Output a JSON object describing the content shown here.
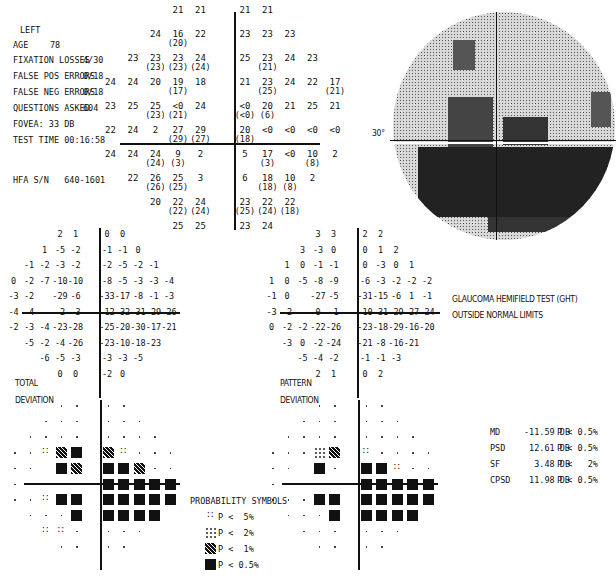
{
  "header": {
    "eye": "LEFT",
    "age_label": "AGE",
    "age": "78",
    "fixation_losses_label": "FIXATION LOSSES",
    "fixation_losses": "4/30",
    "false_pos_label": "FALSE POS ERRORS",
    "false_pos": "0/18",
    "false_neg_label": "FALSE NEG ERRORS",
    "false_neg": "0/18",
    "questions_label": "QUESTIONS ASKED",
    "questions": "604",
    "fovea": "FOVEA: 33 DB",
    "test_time": "TEST TIME 00:16:58",
    "hfa_sn": "HFA S/N   640-1601"
  },
  "threshold_grid": {
    "rows": [
      {
        "y": 4,
        "cells": [
          [
            "21",
            ""
          ],
          [
            "21",
            ""
          ],
          [
            "21",
            ""
          ],
          [
            "21",
            ""
          ]
        ],
        "cols": [
          -2,
          -1,
          0,
          1
        ]
      },
      {
        "y": 3,
        "cells": [
          [
            "24",
            ""
          ],
          [
            "16",
            "(20)"
          ],
          [
            "22",
            ""
          ],
          [
            "23",
            ""
          ],
          [
            "23",
            ""
          ],
          [
            "23",
            ""
          ]
        ],
        "cols": [
          -3,
          -2,
          -1,
          0,
          1,
          2
        ]
      },
      {
        "y": 2,
        "cells": [
          [
            "23",
            ""
          ],
          [
            "23",
            "(23)"
          ],
          [
            "23",
            "(23)"
          ],
          [
            "24",
            "(24)"
          ],
          [
            "25",
            ""
          ],
          [
            "23",
            "(21)"
          ],
          [
            "24",
            ""
          ],
          [
            "23",
            ""
          ]
        ],
        "cols": [
          -4,
          -3,
          -2,
          -1,
          0,
          1,
          2,
          3
        ]
      },
      {
        "y": 1,
        "cells": [
          [
            "24",
            ""
          ],
          [
            "24",
            ""
          ],
          [
            "20",
            ""
          ],
          [
            "19",
            "(17)"
          ],
          [
            "18",
            ""
          ],
          [
            "21",
            ""
          ],
          [
            "23",
            "(25)"
          ],
          [
            "24",
            ""
          ],
          [
            "22",
            ""
          ],
          [
            "17",
            "(21)"
          ]
        ],
        "cols": [
          -5,
          -4,
          -3,
          -2,
          -1,
          0,
          1,
          2,
          3,
          4
        ]
      },
      {
        "y": 0,
        "cells": [
          [
            "23",
            ""
          ],
          [
            "25",
            ""
          ],
          [
            "25",
            "(23)"
          ],
          [
            "<0",
            "(21)"
          ],
          [
            "24",
            ""
          ],
          [
            "<0",
            "(<0)"
          ],
          [
            "20",
            "(6)"
          ],
          [
            "21",
            ""
          ],
          [
            "25",
            ""
          ],
          [
            "21",
            ""
          ]
        ],
        "cols": [
          -5,
          -4,
          -3,
          -2,
          -1,
          0,
          1,
          2,
          3,
          4
        ]
      },
      {
        "y": -1,
        "cells": [
          [
            "22",
            ""
          ],
          [
            "24",
            ""
          ],
          [
            "2",
            ""
          ],
          [
            "27",
            "(29)"
          ],
          [
            "29",
            "(27)"
          ],
          [
            "20",
            "(18)"
          ],
          [
            "<0",
            ""
          ],
          [
            "<0",
            ""
          ],
          [
            "<0",
            ""
          ],
          [
            "<0",
            ""
          ]
        ],
        "cols": [
          -5,
          -4,
          -3,
          -2,
          -1,
          0,
          1,
          2,
          3,
          4
        ]
      },
      {
        "y": -2,
        "cells": [
          [
            "24",
            ""
          ],
          [
            "24",
            ""
          ],
          [
            "24",
            "(24)"
          ],
          [
            "9",
            "(3)"
          ],
          [
            "2",
            ""
          ],
          [
            "5",
            ""
          ],
          [
            "17",
            "(3)"
          ],
          [
            "<0",
            ""
          ],
          [
            "10",
            "(8)"
          ],
          [
            "2",
            ""
          ]
        ],
        "cols": [
          -5,
          -4,
          -3,
          -2,
          -1,
          0,
          1,
          2,
          3,
          4
        ]
      },
      {
        "y": -3,
        "cells": [
          [
            "22",
            ""
          ],
          [
            "26",
            "(26)"
          ],
          [
            "25",
            "(25)"
          ],
          [
            "3",
            ""
          ],
          [
            "6",
            ""
          ],
          [
            "18",
            "(18)"
          ],
          [
            "10",
            "(8)"
          ],
          [
            "2",
            ""
          ]
        ],
        "cols": [
          -4,
          -3,
          -2,
          -1,
          0,
          1,
          2,
          3
        ]
      },
      {
        "y": -4,
        "cells": [
          [
            "20",
            ""
          ],
          [
            "22",
            "(22)"
          ],
          [
            "24",
            "(24)"
          ],
          [
            "23",
            "(25)"
          ],
          [
            "22",
            "(24)"
          ],
          [
            "22",
            "(18)"
          ]
        ],
        "cols": [
          -3,
          -2,
          -1,
          0,
          1,
          2
        ]
      },
      {
        "y": -5,
        "cells": [
          [
            "25",
            ""
          ],
          [
            "25",
            ""
          ],
          [
            "23",
            ""
          ],
          [
            "24",
            ""
          ]
        ],
        "cols": [
          -2,
          -1,
          0,
          1
        ]
      }
    ]
  },
  "greyscale": {
    "label": "30°"
  },
  "total_deviation": {
    "label_1": "TOTAL",
    "label_2": "DEVIATION",
    "rows": [
      {
        "cols": [
          -2,
          -1,
          0,
          1
        ],
        "vals": [
          "2",
          "1",
          "0",
          "0"
        ]
      },
      {
        "cols": [
          -3,
          -2,
          -1,
          0,
          1,
          2
        ],
        "vals": [
          "1",
          "-5",
          "-2",
          "-1",
          "-1",
          "0"
        ]
      },
      {
        "cols": [
          -4,
          -3,
          -2,
          -1,
          0,
          1,
          2,
          3
        ],
        "vals": [
          "-1",
          "-2",
          "-3",
          "-2",
          "-2",
          "-5",
          "-2",
          "-1"
        ]
      },
      {
        "cols": [
          -5,
          -4,
          -3,
          -2,
          -1,
          0,
          1,
          2,
          3,
          4
        ],
        "vals": [
          "0",
          "-2",
          "-7",
          "-10",
          "-10",
          "-8",
          "-5",
          "-3",
          "-3",
          "-4"
        ]
      },
      {
        "cols": [
          -5,
          -4,
          -2,
          -1,
          0,
          1,
          2,
          3,
          4
        ],
        "vals": [
          "-3",
          "-2",
          "-29",
          "-6",
          "-33",
          "-17",
          "-8",
          "-1",
          "-3"
        ]
      },
      {
        "cols": [
          -5,
          -4,
          -2,
          -1,
          0,
          1,
          2,
          3,
          4
        ],
        "vals": [
          "-4",
          "-4",
          "-2",
          "-3",
          "-12",
          "-32",
          "-31",
          "-29",
          "-26"
        ]
      },
      {
        "cols": [
          -5,
          -4,
          -3,
          -2,
          -1,
          0,
          1,
          2,
          3,
          4
        ],
        "vals": [
          "-2",
          "-3",
          "-4",
          "-23",
          "-28",
          "-25",
          "-20",
          "-30",
          "-17",
          "-21"
        ]
      },
      {
        "cols": [
          -4,
          -3,
          -2,
          -1,
          0,
          1,
          2,
          3
        ],
        "vals": [
          "-5",
          "-2",
          "-4",
          "-26",
          "-23",
          "-10",
          "-18",
          "-23"
        ]
      },
      {
        "cols": [
          -3,
          -2,
          -1,
          0,
          1,
          2
        ],
        "vals": [
          "-6",
          "-5",
          "-3",
          "-3",
          "-3",
          "-5"
        ]
      },
      {
        "cols": [
          -2,
          -1,
          0,
          1
        ],
        "vals": [
          "0",
          "0",
          "-2",
          "0"
        ]
      }
    ],
    "prob_rows": [
      {
        "cols": [
          -2,
          -1,
          0,
          1
        ],
        "s": [
          "dot",
          "dot",
          "dot",
          "dot"
        ]
      },
      {
        "cols": [
          -3,
          -2,
          -1,
          0,
          1,
          2
        ],
        "s": [
          "dot",
          "dot",
          "dot",
          "dot",
          "dot",
          "dot"
        ]
      },
      {
        "cols": [
          -4,
          -3,
          -2,
          -1,
          0,
          1,
          2,
          3
        ],
        "s": [
          "dot",
          "dot",
          "dot",
          "dot",
          "dot",
          "dot",
          "dot",
          "dot"
        ]
      },
      {
        "cols": [
          -5,
          -4,
          -3,
          -2,
          -1,
          0,
          1,
          2,
          3,
          4
        ],
        "s": [
          "dot",
          "dot",
          "p5",
          "p1",
          "p05",
          "p1",
          "p5",
          "dot",
          "dot",
          "dot"
        ]
      },
      {
        "cols": [
          -5,
          -4,
          -2,
          -1,
          0,
          1,
          2,
          3,
          4
        ],
        "s": [
          "dot",
          "dot",
          "p05",
          "p1",
          "p05",
          "p05",
          "p1",
          "dot",
          "dot"
        ]
      },
      {
        "cols": [
          -5,
          -4,
          -2,
          -1,
          0,
          1,
          2,
          3,
          4
        ],
        "s": [
          "dot",
          "dot",
          "dot",
          "dot",
          "p05",
          "p05",
          "p05",
          "p05",
          "p05"
        ]
      },
      {
        "cols": [
          -5,
          -4,
          -3,
          -2,
          -1,
          0,
          1,
          2,
          3,
          4
        ],
        "s": [
          "dot",
          "dot",
          "p5",
          "p05",
          "p05",
          "p05",
          "p05",
          "p05",
          "p05",
          "p05"
        ]
      },
      {
        "cols": [
          -4,
          -3,
          -2,
          -1,
          0,
          1,
          2,
          3
        ],
        "s": [
          "dot",
          "dot",
          "dot",
          "p05",
          "p05",
          "p05",
          "p05",
          "p05"
        ]
      },
      {
        "cols": [
          -3,
          -2,
          -1,
          0,
          1,
          2
        ],
        "s": [
          "p5",
          "p5",
          "dot",
          "dot",
          "dot",
          "dot"
        ]
      },
      {
        "cols": [
          -2,
          -1,
          0,
          1
        ],
        "s": [
          "dot",
          "dot",
          "dot",
          "dot"
        ]
      }
    ]
  },
  "pattern_deviation": {
    "label_1": "PATTERN",
    "label_2": "DEVIATION",
    "rows": [
      {
        "cols": [
          -2,
          -1,
          0,
          1
        ],
        "vals": [
          "3",
          "3",
          "2",
          "2"
        ]
      },
      {
        "cols": [
          -3,
          -2,
          -1,
          0,
          1,
          2
        ],
        "vals": [
          "3",
          "-3",
          "0",
          "0",
          "1",
          "2"
        ]
      },
      {
        "cols": [
          -4,
          -3,
          -2,
          -1,
          0,
          1,
          2,
          3
        ],
        "vals": [
          "1",
          "0",
          "-1",
          "-1",
          "0",
          "-3",
          "0",
          "1"
        ]
      },
      {
        "cols": [
          -5,
          -4,
          -3,
          -2,
          -1,
          0,
          1,
          2,
          3,
          4
        ],
        "vals": [
          "1",
          "0",
          "-5",
          "-8",
          "-9",
          "-6",
          "-3",
          "-2",
          "-2",
          "-2"
        ]
      },
      {
        "cols": [
          -5,
          -4,
          -2,
          -1,
          0,
          1,
          2,
          3,
          4
        ],
        "vals": [
          "-1",
          "0",
          "-27",
          "-5",
          "-31",
          "-15",
          "-6",
          "1",
          "-1"
        ]
      },
      {
        "cols": [
          -5,
          -4,
          -2,
          -1,
          0,
          1,
          2,
          3,
          4
        ],
        "vals": [
          "-3",
          "-2",
          "0",
          "-1",
          "-10",
          "-31",
          "-29",
          "-27",
          "-24"
        ]
      },
      {
        "cols": [
          -5,
          -4,
          -3,
          -2,
          -1,
          0,
          1,
          2,
          3,
          4
        ],
        "vals": [
          "0",
          "-2",
          "-2",
          "-22",
          "-26",
          "-23",
          "-18",
          "-29",
          "-16",
          "-20"
        ]
      },
      {
        "cols": [
          -4,
          -3,
          -2,
          -1,
          0,
          1,
          2,
          3
        ],
        "vals": [
          "-3",
          "0",
          "-2",
          "-24",
          "-21",
          "-8",
          "-16",
          "-21"
        ]
      },
      {
        "cols": [
          -3,
          -2,
          -1,
          0,
          1,
          2
        ],
        "vals": [
          "-5",
          "-4",
          "-2",
          "-1",
          "-1",
          "-3"
        ]
      },
      {
        "cols": [
          -2,
          -1,
          0,
          1
        ],
        "vals": [
          "2",
          "1",
          "0",
          "2"
        ]
      }
    ],
    "prob_rows": [
      {
        "cols": [
          -2,
          -1,
          0,
          1
        ],
        "s": [
          "dot",
          "dot",
          "dot",
          "dot"
        ]
      },
      {
        "cols": [
          -3,
          -2,
          -1,
          0,
          1,
          2
        ],
        "s": [
          "dot",
          "dot",
          "dot",
          "dot",
          "dot",
          "dot"
        ]
      },
      {
        "cols": [
          -4,
          -3,
          -2,
          -1,
          0,
          1,
          2,
          3
        ],
        "s": [
          "dot",
          "dot",
          "dot",
          "dot",
          "dot",
          "dot",
          "dot",
          "dot"
        ]
      },
      {
        "cols": [
          -5,
          -4,
          -3,
          -2,
          -1,
          0,
          1,
          2,
          3,
          4
        ],
        "s": [
          "dot",
          "dot",
          "dot",
          "p2",
          "p1",
          "p5",
          "dot",
          "dot",
          "dot",
          "dot"
        ]
      },
      {
        "cols": [
          -5,
          -4,
          -2,
          -1,
          0,
          1,
          2,
          3,
          4
        ],
        "s": [
          "dot",
          "dot",
          "p05",
          "dot",
          "p05",
          "p05",
          "p5",
          "dot",
          "dot"
        ]
      },
      {
        "cols": [
          -5,
          -4,
          -2,
          -1,
          0,
          1,
          2,
          3,
          4
        ],
        "s": [
          "dot",
          "dot",
          "dot",
          "dot",
          "p05",
          "p05",
          "p05",
          "p05",
          "p05"
        ]
      },
      {
        "cols": [
          -5,
          -4,
          -3,
          -2,
          -1,
          0,
          1,
          2,
          3,
          4
        ],
        "s": [
          "dot",
          "dot",
          "dot",
          "p05",
          "p05",
          "p05",
          "p05",
          "p05",
          "p05",
          "p05"
        ]
      },
      {
        "cols": [
          -4,
          -3,
          -2,
          -1,
          0,
          1,
          2,
          3
        ],
        "s": [
          "dot",
          "dot",
          "dot",
          "p05",
          "p05",
          "p05",
          "p05",
          "p05"
        ]
      },
      {
        "cols": [
          -3,
          -2,
          -1,
          0,
          1,
          2
        ],
        "s": [
          "dot",
          "dot",
          "dot",
          "dot",
          "dot",
          "dot"
        ]
      },
      {
        "cols": [
          -2,
          -1,
          0,
          1
        ],
        "s": [
          "dot",
          "dot",
          "dot",
          "dot"
        ]
      }
    ]
  },
  "ght": {
    "line1": "GLAUCOMA HEMIFIELD TEST (GHT)",
    "line2": "OUTSIDE NORMAL LIMITS"
  },
  "legend": {
    "title": "PROBABILITY SYMBOLS",
    "items": [
      {
        "sym": "p5",
        "text": "P <  5%"
      },
      {
        "sym": "p2",
        "text": "P <  2%"
      },
      {
        "sym": "p1",
        "text": "P <  1%"
      },
      {
        "sym": "p05",
        "text": "P < 0.5%"
      }
    ]
  },
  "global_indices": [
    {
      "name": "MD",
      "value": "-11.59 DB",
      "p": "P < 0.5%"
    },
    {
      "name": "PSD",
      "value": "12.61 DB",
      "p": "P < 0.5%"
    },
    {
      "name": "SF",
      "value": "3.48 DB",
      "p": "P <   2%"
    },
    {
      "name": "CPSD",
      "value": "11.98 DB",
      "p": "P < 0.5%"
    }
  ]
}
